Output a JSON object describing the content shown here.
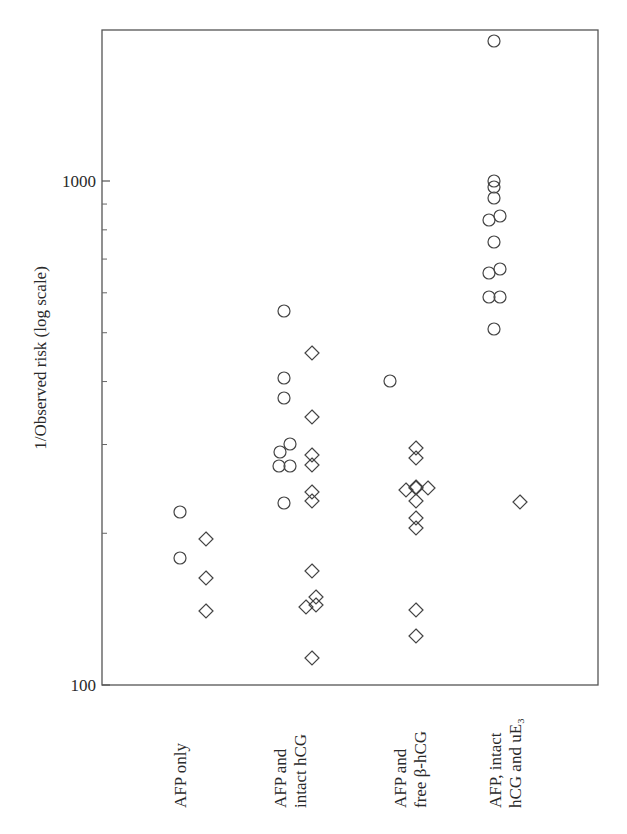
{
  "chart_data": {
    "type": "scatter",
    "title": "",
    "xlabel": "",
    "ylabel": "1/Observed risk (log scale)",
    "yscale": "log",
    "ylim": [
      100,
      2000
    ],
    "yticks": [
      {
        "value": 100,
        "label": "100"
      },
      {
        "value": 1000,
        "label": "1000"
      }
    ],
    "minor_yticks": [
      200,
      300,
      400,
      500,
      600,
      700,
      800,
      900
    ],
    "grid": false,
    "legend": null,
    "categories": [
      {
        "lines": [
          "AFP only"
        ]
      },
      {
        "lines": [
          "AFP and",
          "intact hCG"
        ]
      },
      {
        "lines": [
          "AFP and",
          "free β-hCG"
        ]
      },
      {
        "lines": [
          "AFP, intact",
          "hCG and uE₃"
        ]
      }
    ],
    "series": [
      {
        "name": "circles",
        "marker": "circle",
        "points": [
          {
            "category": 0,
            "value": 220
          },
          {
            "category": 0,
            "value": 179
          },
          {
            "category": 1,
            "value": 552
          },
          {
            "category": 1,
            "value": 406
          },
          {
            "category": 1,
            "value": 371
          },
          {
            "category": 1,
            "value": 301
          },
          {
            "category": 1,
            "value": 290
          },
          {
            "category": 1,
            "value": 272
          },
          {
            "category": 1,
            "value": 272
          },
          {
            "category": 1,
            "value": 230
          },
          {
            "category": 2,
            "value": 401
          },
          {
            "category": 3,
            "value": 1896
          },
          {
            "category": 3,
            "value": 1000
          },
          {
            "category": 3,
            "value": 973
          },
          {
            "category": 3,
            "value": 930
          },
          {
            "category": 3,
            "value": 840
          },
          {
            "category": 3,
            "value": 855
          },
          {
            "category": 3,
            "value": 757
          },
          {
            "category": 3,
            "value": 660
          },
          {
            "category": 3,
            "value": 672
          },
          {
            "category": 3,
            "value": 590
          },
          {
            "category": 3,
            "value": 590
          },
          {
            "category": 3,
            "value": 511
          }
        ]
      },
      {
        "name": "diamonds",
        "marker": "diamond",
        "points": [
          {
            "category": 0,
            "value": 195
          },
          {
            "category": 0,
            "value": 163
          },
          {
            "category": 0,
            "value": 140
          },
          {
            "category": 1,
            "value": 456
          },
          {
            "category": 1,
            "value": 340
          },
          {
            "category": 1,
            "value": 286
          },
          {
            "category": 1,
            "value": 273
          },
          {
            "category": 1,
            "value": 241
          },
          {
            "category": 1,
            "value": 232
          },
          {
            "category": 1,
            "value": 168
          },
          {
            "category": 1,
            "value": 150
          },
          {
            "category": 1,
            "value": 145
          },
          {
            "category": 1,
            "value": 143
          },
          {
            "category": 1,
            "value": 113
          },
          {
            "category": 2,
            "value": 295
          },
          {
            "category": 2,
            "value": 282
          },
          {
            "category": 2,
            "value": 246
          },
          {
            "category": 2,
            "value": 246
          },
          {
            "category": 2,
            "value": 244
          },
          {
            "category": 2,
            "value": 246
          },
          {
            "category": 2,
            "value": 232
          },
          {
            "category": 2,
            "value": 214
          },
          {
            "category": 2,
            "value": 205
          },
          {
            "category": 2,
            "value": 141
          },
          {
            "category": 2,
            "value": 125
          },
          {
            "category": 3,
            "value": 231
          }
        ]
      }
    ]
  },
  "layout_points": {
    "circles": [
      [
        180,
        512
      ],
      [
        180,
        558
      ],
      [
        284,
        311
      ],
      [
        284,
        378
      ],
      [
        284,
        398
      ],
      [
        290,
        444
      ],
      [
        280,
        452
      ],
      [
        279,
        466
      ],
      [
        290,
        466
      ],
      [
        284,
        503
      ],
      [
        390,
        381
      ],
      [
        494,
        41
      ],
      [
        494,
        181
      ],
      [
        494,
        187
      ],
      [
        494,
        198
      ],
      [
        489,
        220
      ],
      [
        500,
        216
      ],
      [
        494,
        242
      ],
      [
        489,
        273
      ],
      [
        500,
        269
      ],
      [
        489,
        297
      ],
      [
        500,
        297
      ],
      [
        494,
        329
      ]
    ],
    "diamonds": [
      [
        206,
        539
      ],
      [
        206,
        578
      ],
      [
        206,
        611
      ],
      [
        312,
        353
      ],
      [
        312,
        417
      ],
      [
        312,
        455
      ],
      [
        312,
        465
      ],
      [
        312,
        492
      ],
      [
        312,
        501
      ],
      [
        312,
        571
      ],
      [
        316,
        597
      ],
      [
        306,
        607
      ],
      [
        316,
        605
      ],
      [
        312,
        658
      ],
      [
        416,
        448
      ],
      [
        416,
        458
      ],
      [
        416,
        488
      ],
      [
        416,
        487
      ],
      [
        406,
        490
      ],
      [
        428,
        488
      ],
      [
        416,
        501
      ],
      [
        416,
        518
      ],
      [
        416,
        528
      ],
      [
        416,
        610
      ],
      [
        416,
        636
      ],
      [
        520,
        502
      ]
    ],
    "category_x": [
      180,
      290,
      410,
      505
    ]
  }
}
